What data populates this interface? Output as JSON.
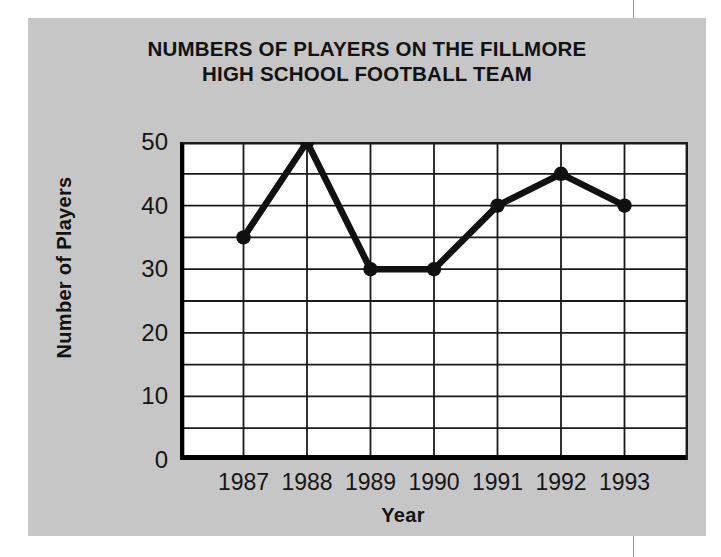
{
  "chart_data": {
    "type": "line",
    "title": "NUMBERS OF PLAYERS ON THE FILLMORE HIGH SCHOOL FOOTBALL TEAM",
    "title_lines": [
      "NUMBERS OF PLAYERS ON THE FILLMORE",
      "HIGH SCHOOL FOOTBALL TEAM"
    ],
    "xlabel": "Year",
    "ylabel": "Number of Players",
    "categories": [
      "1987",
      "1988",
      "1989",
      "1990",
      "1991",
      "1992",
      "1993"
    ],
    "values": [
      35,
      50,
      30,
      30,
      40,
      45,
      40
    ],
    "series": [
      {
        "name": "Number of Players",
        "values": [
          35,
          50,
          30,
          30,
          40,
          45,
          40
        ]
      }
    ],
    "ylim": [
      0,
      50
    ],
    "ytick_labels": [
      "0",
      "10",
      "20",
      "30",
      "40",
      "50"
    ],
    "ytick_values": [
      0,
      10,
      20,
      30,
      40,
      50
    ],
    "y_major_step": 10,
    "y_minor_step": 5,
    "grid": "both",
    "grid_horizontal_step": 5,
    "legend": "none",
    "marker": "circle",
    "colors": {
      "panel_background": "#c6c6c6",
      "plot_background": "#ffffff",
      "line": "#101010",
      "marker": "#101010",
      "grid": "#1a1a1a",
      "axis": "#000000",
      "text": "#121212"
    }
  }
}
